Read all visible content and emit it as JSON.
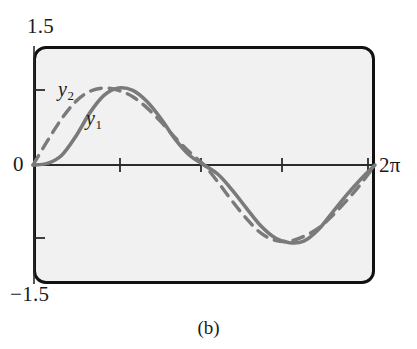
{
  "figure": {
    "caption": "(b)",
    "y_max_label": "1.5",
    "y_min_label": "−1.5",
    "y_zero_label": "0",
    "x_max_label": "2π",
    "series_label_1": "y",
    "series_label_1_sub": "1",
    "series_label_2": "y",
    "series_label_2_sub": "2",
    "colors": {
      "frame": "#111111",
      "plot_background": "#f1f1f1",
      "axis": "#2b2b2b",
      "curve": "#7a7a7a",
      "page_background": "#ffffff",
      "text": "#1a1a1a"
    }
  },
  "chart_data": {
    "type": "line",
    "title": "",
    "subtitle": "",
    "xlabel": "",
    "ylabel": "",
    "xlim": [
      0,
      6.283185
    ],
    "ylim": [
      -1.5,
      1.5
    ],
    "grid": false,
    "legend": "inline-annotations",
    "xticks": [
      0,
      1.5708,
      3.14159,
      4.71239,
      6.28319
    ],
    "xticklabels": [
      "0",
      "",
      "",
      "",
      "2π"
    ],
    "yticks": [
      -1.5,
      -1,
      0,
      1,
      1.5
    ],
    "yticklabels": [
      "−1.5",
      "",
      "0",
      "",
      "1.5"
    ],
    "annotations": [
      {
        "text": "y₂",
        "x": 0.75,
        "y": 1.12,
        "series": "y2"
      },
      {
        "text": "y₁",
        "x": 1.32,
        "y": 0.68,
        "series": "y1"
      }
    ],
    "series": [
      {
        "name": "y1",
        "label": "y₁",
        "style": "solid",
        "color": "#7a7a7a",
        "description": "Solid gray curve: roughly sin-like wave with flattened/shifted shape, zero at x=0, peak near x=1.6, descending zero-crossing near x=3.14, minimum near x=4.85, returning to zero at x=2π",
        "x": [
          0.0,
          0.262,
          0.524,
          0.785,
          1.047,
          1.309,
          1.571,
          1.833,
          2.094,
          2.356,
          2.618,
          2.88,
          3.142,
          3.403,
          3.665,
          3.927,
          4.189,
          4.451,
          4.712,
          4.974,
          5.236,
          5.498,
          5.76,
          6.021,
          6.283
        ],
        "y": [
          0.0,
          0.02,
          0.12,
          0.36,
          0.66,
          0.88,
          0.97,
          0.94,
          0.8,
          0.58,
          0.32,
          0.12,
          0.0,
          -0.12,
          -0.32,
          -0.55,
          -0.77,
          -0.92,
          -0.98,
          -0.96,
          -0.82,
          -0.6,
          -0.38,
          -0.18,
          0.0
        ]
      },
      {
        "name": "y2",
        "label": "y₂",
        "style": "dashed",
        "color": "#7a7a7a",
        "description": "Dashed gray curve: sine-like wave leading y1 in phase, rising quickly from 0, peak near x=1.1, zero-crossing near x=3.14, minimum near x=4.5, returning to zero at x=2π",
        "x": [
          0.0,
          0.262,
          0.524,
          0.785,
          1.047,
          1.309,
          1.571,
          1.833,
          2.094,
          2.356,
          2.618,
          2.88,
          3.142,
          3.403,
          3.665,
          3.927,
          4.189,
          4.451,
          4.712,
          4.974,
          5.236,
          5.498,
          5.76,
          6.021,
          6.283
        ],
        "y": [
          0.0,
          0.3,
          0.58,
          0.8,
          0.93,
          0.97,
          0.94,
          0.86,
          0.72,
          0.54,
          0.34,
          0.16,
          0.0,
          -0.22,
          -0.46,
          -0.68,
          -0.86,
          -0.95,
          -0.96,
          -0.9,
          -0.8,
          -0.64,
          -0.45,
          -0.24,
          0.0
        ]
      }
    ]
  }
}
